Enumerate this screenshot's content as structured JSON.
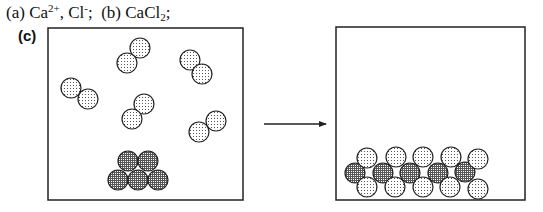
{
  "caption": {
    "part_a_label": "(a)",
    "part_a_ion1_base": "Ca",
    "part_a_ion1_charge": "2+",
    "part_a_separator": ",",
    "part_a_ion2_base": "Cl",
    "part_a_ion2_charge": "-",
    "part_a_end": ";",
    "part_b_label": "(b)",
    "part_b_formula_base": "CaCl",
    "part_b_formula_sub": "2",
    "part_b_end": ";"
  },
  "part_c_label": "(c)",
  "colors": {
    "outline": "#222222",
    "cl_fill_dots": "#555555",
    "ca_grid": "#444444",
    "background": "#ffffff"
  },
  "diagram": {
    "left_box": {
      "x": 48,
      "y": 28,
      "width": 195,
      "height": 172
    },
    "right_box": {
      "x": 336,
      "y": 27,
      "width": 189,
      "height": 173
    },
    "arrow": {
      "x1": 264,
      "y1": 124,
      "x2": 326,
      "y2": 124
    },
    "particle_radius": 10,
    "left_molecules_cl2": [
      [
        [
          140,
          48
        ],
        [
          127,
          63
        ]
      ],
      [
        [
          190,
          60
        ],
        [
          202,
          74
        ]
      ],
      [
        [
          71,
          88
        ],
        [
          88,
          99
        ]
      ],
      [
        [
          144,
          104
        ],
        [
          132,
          119
        ]
      ],
      [
        [
          216,
          121
        ],
        [
          199,
          132
        ]
      ]
    ],
    "left_calcium_pile": [
      [
        128,
        161
      ],
      [
        148,
        161
      ],
      [
        118,
        180
      ],
      [
        138,
        180
      ],
      [
        158,
        180
      ]
    ],
    "right_lattice_cl_top": [
      [
        367,
        158
      ],
      [
        396,
        157
      ],
      [
        423,
        157
      ],
      [
        451,
        157
      ],
      [
        478,
        159
      ]
    ],
    "right_lattice_ca_middle": [
      [
        355,
        173
      ],
      [
        383,
        173
      ],
      [
        410,
        173
      ],
      [
        438,
        173
      ],
      [
        465,
        172
      ]
    ],
    "right_lattice_cl_bottom": [
      [
        367,
        187
      ],
      [
        395,
        187
      ],
      [
        423,
        187
      ],
      [
        450,
        187
      ],
      [
        478,
        189
      ]
    ]
  }
}
